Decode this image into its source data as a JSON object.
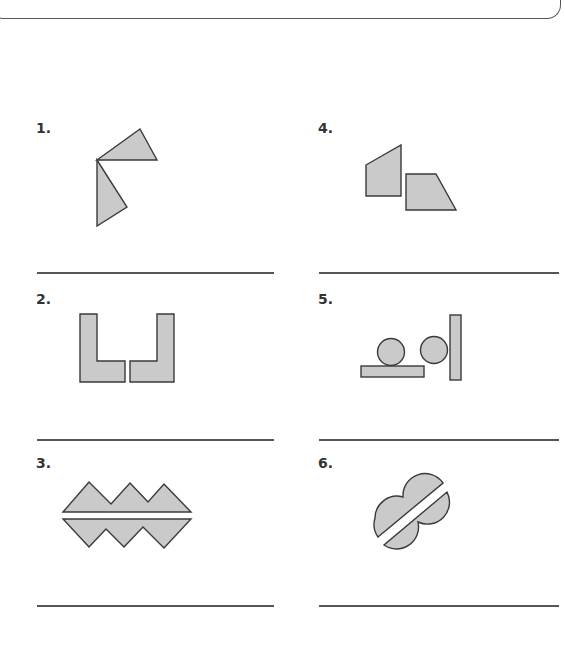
{
  "worksheet": {
    "items": [
      {
        "number": "1.",
        "figure": "two-triangles-sharing-vertex",
        "answer": ""
      },
      {
        "number": "2.",
        "figure": "two-mirrored-L-shapes",
        "answer": ""
      },
      {
        "number": "3.",
        "figure": "two-zigzag-strips",
        "answer": ""
      },
      {
        "number": "4.",
        "figure": "two-quadrilaterals",
        "answer": ""
      },
      {
        "number": "5.",
        "figure": "circles-and-rectangles",
        "answer": ""
      },
      {
        "number": "6.",
        "figure": "split-overlapping-circles",
        "answer": ""
      }
    ],
    "colors": {
      "shape_fill": "#cacaca",
      "shape_stroke": "#3a3a3a",
      "rule": "#555555"
    }
  }
}
